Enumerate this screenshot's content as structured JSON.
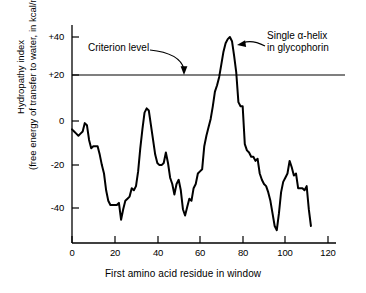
{
  "chart_data": {
    "type": "line",
    "title": "",
    "xlabel": "First amino acid residue in window",
    "ylabel_line1": "Hydropathy index",
    "ylabel_line2": "(free energy of transfer to water, in kcal/mol)",
    "xlim": [
      0,
      127
    ],
    "ylim": [
      -57,
      48
    ],
    "xticks": [
      0,
      20,
      40,
      60,
      80,
      100,
      120
    ],
    "xtick_labels": [
      "0",
      "20",
      "40",
      "60",
      "80",
      "100",
      "120"
    ],
    "yticks": [
      40,
      20,
      0,
      -20,
      -40
    ],
    "ytick_labels": [
      "+40",
      "+20",
      "0",
      "-20",
      "-40"
    ],
    "grid": false,
    "legend": "none",
    "line_color": "#000000",
    "line_width": 2.0,
    "reference_lines": [
      {
        "name": "criterion-level",
        "value": 20,
        "orientation": "horizontal",
        "label": "Criterion level",
        "color": "#000000"
      }
    ],
    "annotations": [
      {
        "name": "criterion-level-annotation",
        "text": "Criterion level",
        "points_to_x": 55,
        "points_to_y": 20
      },
      {
        "name": "alpha-helix-annotation",
        "text_line1": "Single α-helix",
        "text_line2": "in glycophorin",
        "points_to_x": 76,
        "points_to_y": 36
      }
    ],
    "series": [
      {
        "name": "hydropathy",
        "x": [
          0,
          1,
          2,
          3,
          4,
          5,
          6,
          7,
          8,
          9,
          10,
          11,
          12,
          13,
          14,
          15,
          16,
          17,
          18,
          19,
          20,
          21,
          22,
          23,
          24,
          25,
          26,
          27,
          28,
          29,
          30,
          31,
          32,
          33,
          34,
          35,
          36,
          37,
          38,
          39,
          40,
          41,
          42,
          43,
          44,
          45,
          46,
          47,
          48,
          49,
          50,
          51,
          52,
          53,
          54,
          55,
          56,
          57,
          58,
          59,
          60,
          61,
          62,
          63,
          64,
          65,
          66,
          67,
          68,
          69,
          70,
          71,
          72,
          73,
          74,
          75,
          76,
          77,
          78,
          79,
          80,
          81,
          82,
          83,
          84,
          85,
          86,
          87,
          88,
          89,
          90,
          91,
          92,
          93,
          94,
          95,
          96,
          97,
          98,
          99,
          100,
          101,
          102,
          103,
          104,
          105,
          106,
          107,
          108,
          109,
          110,
          111,
          112
        ],
        "y": [
          -4,
          -5,
          -6,
          -7,
          -6,
          -5,
          -1,
          -2,
          -9,
          -13,
          -12,
          -12,
          -12,
          -16,
          -21,
          -25,
          -33,
          -38,
          -40,
          -40,
          -40,
          -40,
          -39,
          -47,
          -42,
          -38,
          -37,
          -36,
          -32,
          -33,
          -31,
          -24,
          -13,
          -4,
          4,
          6,
          5,
          -2,
          -9,
          -16,
          -20,
          -21,
          -21,
          -20,
          -15,
          -20,
          -27,
          -30,
          -35,
          -30,
          -28,
          -33,
          -42,
          -45,
          -41,
          -37,
          -38,
          -32,
          -30,
          -25,
          -24,
          -23,
          -12,
          -7,
          -3,
          1,
          7,
          14,
          17,
          21,
          27,
          33,
          37,
          39,
          40,
          38,
          31,
          23,
          9,
          7,
          7,
          -11,
          -14,
          -15,
          -17,
          -17,
          -19,
          -18,
          -25,
          -28,
          -30,
          -31,
          -34,
          -38,
          -44,
          -50,
          -52,
          -44,
          -34,
          -29,
          -27,
          -25,
          -19,
          -22,
          -26,
          -25,
          -32,
          -32,
          -32,
          -33,
          -31,
          -42,
          -50
        ]
      }
    ]
  },
  "axis": {
    "x_title": "First amino acid residue in window",
    "y_title_line1": "Hydropathy index",
    "y_title_line2": "(free energy of transfer to water, in kcal/mol)"
  },
  "annotations": {
    "criterion_level": "Criterion level",
    "helix_line1": "Single α-helix",
    "helix_line2": "in glycophorin"
  }
}
